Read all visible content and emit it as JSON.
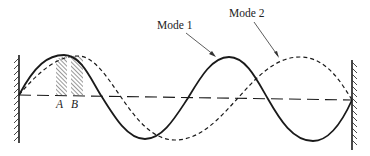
{
  "diagram": {
    "type": "standing-wave-modes",
    "labels": {
      "mode1": "Mode 1",
      "mode2": "Mode 2",
      "pointA": "A",
      "pointB": "B"
    },
    "colors": {
      "stroke": "#1a1a1a",
      "background": "#ffffff"
    },
    "elements": [
      {
        "name": "left-wall",
        "style": "hatched",
        "side": "left"
      },
      {
        "name": "right-wall",
        "style": "hatched",
        "side": "right"
      },
      {
        "name": "baseline",
        "style": "long-dash"
      },
      {
        "name": "mode-1-curve",
        "style": "solid",
        "label": "Mode 1"
      },
      {
        "name": "mode-2-curve",
        "style": "short-dash",
        "label": "Mode 2"
      },
      {
        "name": "region-A",
        "style": "hatched",
        "label": "A"
      },
      {
        "name": "region-B",
        "style": "hatched",
        "label": "B"
      }
    ]
  }
}
